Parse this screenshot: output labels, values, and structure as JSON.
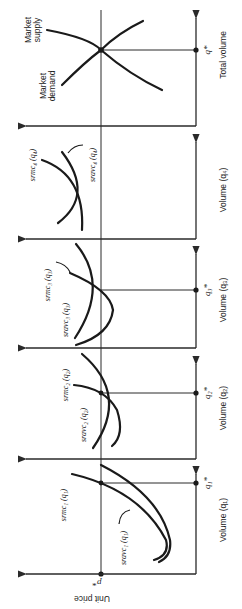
{
  "figure": {
    "orientation": "rotated-90-clockwise",
    "price_axis_label": "Unit price",
    "price_marker": "p*",
    "panels": [
      {
        "id": "firm1",
        "axis_label": "Volume (q₁)",
        "q_marker": "q₁*",
        "curves": [
          {
            "name": "srmc",
            "label": "srmc₁ (q₁)"
          },
          {
            "name": "sravc",
            "label": "sravc₁ (q₁)"
          }
        ]
      },
      {
        "id": "firm2",
        "axis_label": "Volume (q₂)",
        "q_marker": "q₂*",
        "curves": [
          {
            "name": "srmc",
            "label": "srmc₂ (q₂)"
          },
          {
            "name": "sravc",
            "label": "sravc₂ (q₂)"
          }
        ]
      },
      {
        "id": "firm3",
        "axis_label": "Volume (q₃)",
        "q_marker": "q₃*",
        "curves": [
          {
            "name": "srmc",
            "label": "srmc₃ (q₃)"
          },
          {
            "name": "sravc",
            "label": "sravc₃ (q₃)"
          }
        ]
      },
      {
        "id": "firm4",
        "axis_label": "Volume (q₄)",
        "q_marker": "",
        "curves": [
          {
            "name": "srmc",
            "label": "srmc₄ (q₄)"
          },
          {
            "name": "sravc",
            "label": "sravc₄ (q₄)"
          }
        ]
      },
      {
        "id": "market",
        "axis_label": "Total volume",
        "q_marker": "q*",
        "curves": [
          {
            "name": "supply",
            "label": "Market supply"
          },
          {
            "name": "demand",
            "label": "Market demand"
          }
        ]
      }
    ],
    "market_supply_line1": "Market",
    "market_supply_line2": "supply",
    "market_demand_line1": "Market",
    "market_demand_line2": "demand"
  }
}
